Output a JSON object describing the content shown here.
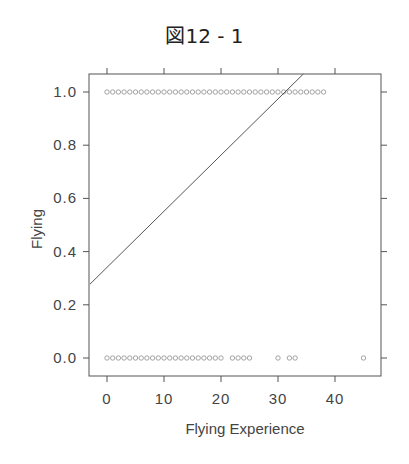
{
  "title": "図12 - 1",
  "chart_data": {
    "type": "scatter",
    "title": "図12 - 1",
    "xlabel": "Flying Experience",
    "ylabel": "Flying",
    "xlim": [
      -3,
      47
    ],
    "ylim": [
      -0.05,
      1.07
    ],
    "xticks": [
      0,
      10,
      20,
      30,
      40
    ],
    "xtick_labels": [
      "0",
      "10",
      "20",
      "30",
      "40"
    ],
    "yticks": [
      0.0,
      0.2,
      0.4,
      0.6,
      0.8,
      1.0
    ],
    "ytick_labels": [
      "0.0",
      "0.2",
      "0.4",
      "0.6",
      "0.8",
      "1.0"
    ],
    "grid": false,
    "legend": null,
    "series": [
      {
        "name": "Flying = 1",
        "marker": "open-circle",
        "x": [
          0,
          1,
          2,
          3,
          4,
          5,
          6,
          7,
          8,
          9,
          10,
          11,
          12,
          13,
          14,
          15,
          16,
          17,
          18,
          19,
          20,
          21,
          22,
          23,
          24,
          25,
          26,
          27,
          28,
          29,
          30,
          31,
          32,
          33,
          34,
          35,
          36,
          37,
          38
        ],
        "y_value": 1.0
      },
      {
        "name": "Flying = 0",
        "marker": "open-circle",
        "x": [
          0,
          1,
          2,
          3,
          4,
          5,
          6,
          7,
          8,
          9,
          10,
          11,
          12,
          13,
          14,
          15,
          16,
          17,
          18,
          19,
          20,
          22,
          23,
          24,
          25,
          30,
          32,
          33,
          45
        ],
        "y_value": 0.0
      }
    ],
    "fit_line": {
      "name": "linear fit",
      "intercept": 0.341,
      "slope": 0.0211
    }
  }
}
